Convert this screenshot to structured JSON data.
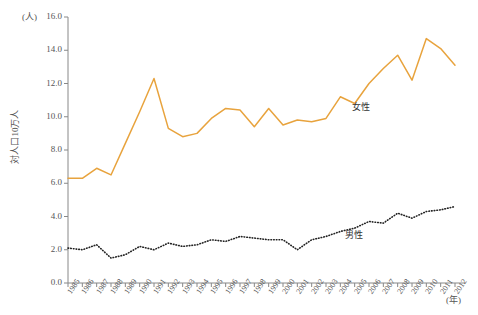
{
  "axes": {
    "y_unit_label": "(人)",
    "x_unit_label": "(年)",
    "y_axis_title": "対人口10万人",
    "y_ticks": [
      "0.0",
      "2.0",
      "4.0",
      "6.0",
      "8.0",
      "10.0",
      "12.0",
      "14.0",
      "16.0"
    ],
    "x_ticks": [
      "1985",
      "1986",
      "1987",
      "1988",
      "1989",
      "1990",
      "1991",
      "1992",
      "1993",
      "1994",
      "1995",
      "1996",
      "1997",
      "1998",
      "1999",
      "2000",
      "2001",
      "2002",
      "2003",
      "2004",
      "2005",
      "2006",
      "2007",
      "2008",
      "2009",
      "2010",
      "2011",
      "2012"
    ]
  },
  "annotations": {
    "female_label": "女性",
    "male_label": "男性"
  },
  "colors": {
    "female_line": "#e8a33d",
    "male_line": "#222222",
    "axis": "#888888",
    "text": "#555555"
  },
  "chart_data": {
    "type": "line",
    "title": "",
    "xlabel": "(年)",
    "ylabel": "対人口10万人",
    "ylim": [
      0.0,
      16.0
    ],
    "ytick_step": 2.0,
    "grid": false,
    "legend_position": "inline-annotation",
    "x": [
      1985,
      1986,
      1987,
      1988,
      1989,
      1990,
      1991,
      1992,
      1993,
      1994,
      1995,
      1996,
      1997,
      1998,
      1999,
      2000,
      2001,
      2002,
      2003,
      2004,
      2005,
      2006,
      2007,
      2008,
      2009,
      2010,
      2011,
      2012
    ],
    "series": [
      {
        "name": "女性",
        "style": "solid",
        "color": "#e8a33d",
        "values": [
          6.3,
          6.3,
          6.9,
          6.5,
          8.4,
          10.3,
          12.3,
          9.3,
          8.8,
          9.0,
          9.9,
          10.5,
          10.4,
          9.4,
          10.5,
          9.5,
          9.8,
          9.7,
          9.9,
          11.2,
          10.8,
          12.0,
          12.9,
          13.7,
          12.2,
          14.7,
          14.1,
          13.1
        ]
      },
      {
        "name": "男性",
        "style": "dotted",
        "color": "#222222",
        "values": [
          2.1,
          2.0,
          2.3,
          1.5,
          1.7,
          2.2,
          2.0,
          2.4,
          2.2,
          2.3,
          2.6,
          2.5,
          2.8,
          2.7,
          2.6,
          2.6,
          2.0,
          2.6,
          2.8,
          3.1,
          3.3,
          3.7,
          3.6,
          4.2,
          3.9,
          4.3,
          4.4,
          4.6
        ]
      }
    ]
  }
}
